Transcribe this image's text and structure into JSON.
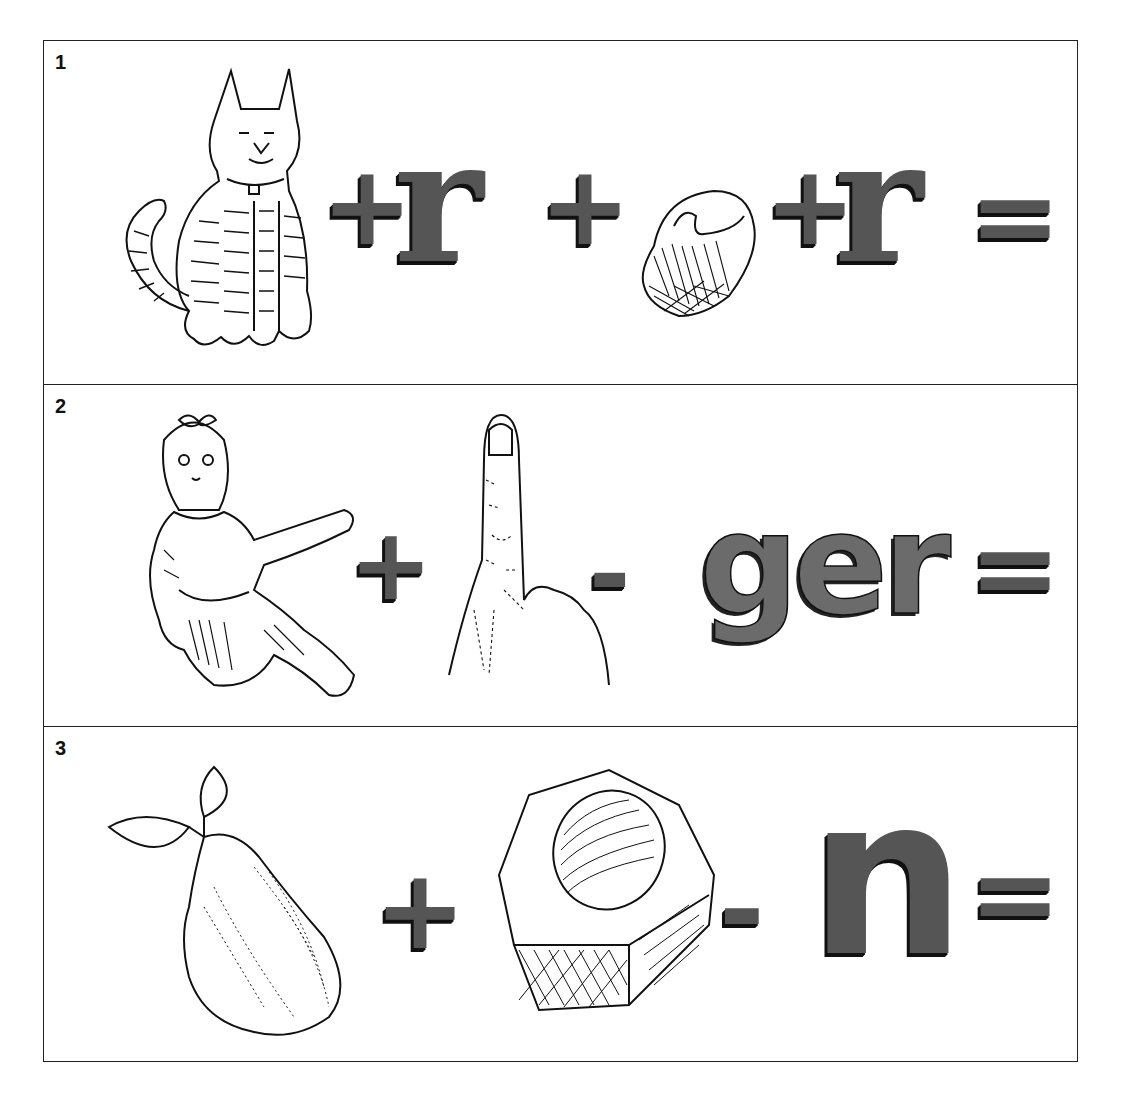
{
  "puzzles": [
    {
      "number": "1",
      "items": [
        {
          "type": "picture",
          "name": "cat"
        },
        {
          "type": "operator",
          "value": "+"
        },
        {
          "type": "letters",
          "value": "r"
        },
        {
          "type": "operator",
          "value": "+"
        },
        {
          "type": "picture",
          "name": "pet-bowl"
        },
        {
          "type": "operator",
          "value": "+"
        },
        {
          "type": "letters",
          "value": "r"
        },
        {
          "type": "operator",
          "value": "="
        }
      ]
    },
    {
      "number": "2",
      "items": [
        {
          "type": "picture",
          "name": "doll"
        },
        {
          "type": "operator",
          "value": "+"
        },
        {
          "type": "picture",
          "name": "finger"
        },
        {
          "type": "operator",
          "value": "-"
        },
        {
          "type": "letters",
          "value": "ger"
        },
        {
          "type": "operator",
          "value": "="
        }
      ]
    },
    {
      "number": "3",
      "items": [
        {
          "type": "picture",
          "name": "pear"
        },
        {
          "type": "operator",
          "value": "+"
        },
        {
          "type": "picture",
          "name": "hex-nut"
        },
        {
          "type": "operator",
          "value": "-"
        },
        {
          "type": "letters",
          "value": "n"
        },
        {
          "type": "operator",
          "value": "="
        }
      ]
    }
  ],
  "colors": {
    "ink": "#111111",
    "fill": "#555555",
    "paper": "#ffffff"
  }
}
